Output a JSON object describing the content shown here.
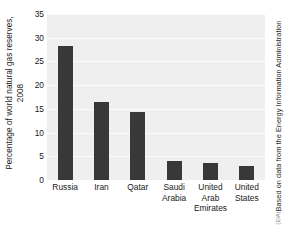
{
  "chart_data": {
    "type": "bar",
    "title": "",
    "xlabel": "",
    "ylabel_line1": "Percentage of world natural gas reserves,",
    "ylabel_line2": "2008",
    "categories": [
      "Russia",
      "Iran",
      "Qatar",
      "Saudi Arabia",
      "United Arab Emirates",
      "United States"
    ],
    "values": [
      28.2,
      16.4,
      14.3,
      4.0,
      3.5,
      3.0
    ],
    "ylim": [
      0,
      35
    ],
    "yticks": [
      0,
      5,
      10,
      15,
      20,
      25,
      30,
      35
    ],
    "ytick_labels": [
      "0",
      "5",
      "10",
      "15",
      "20",
      "25",
      "30",
      "35"
    ],
    "grid": true,
    "legend": "none",
    "bar_color": "#383838",
    "plot_background": "#efeff0",
    "gridline_color": "#fbfbfb",
    "figure_background": "#ffffff"
  },
  "xtick_lines": [
    [
      "Russia"
    ],
    [
      "Iran"
    ],
    [
      "Qatar"
    ],
    [
      "Saudi",
      "Arabia"
    ],
    [
      "United",
      "Arab",
      "Emirates"
    ],
    [
      "United",
      "States"
    ]
  ],
  "credit": {
    "text": "Based on data from the Energy Information Administration",
    "sub": "(EIA)"
  }
}
